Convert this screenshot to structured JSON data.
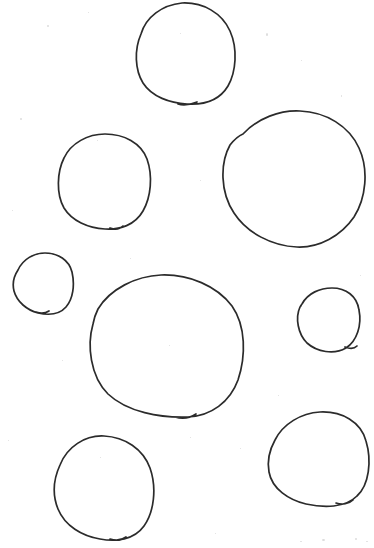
{
  "document": {
    "title": "Hand-drawn circles",
    "kind": "scanned-drawing",
    "width": 374,
    "height": 548,
    "background_color": "#ffffff",
    "ink_color": "#2b2b2b",
    "stroke_width": 1.7,
    "caption": ""
  },
  "shapes": [
    {
      "id": "circle-top-center",
      "name": "Top center circle",
      "size_label": "medium-large",
      "cx": 184,
      "cy": 54,
      "rx": 52,
      "ry": 51,
      "bbox": [
        132,
        3,
        236,
        105
      ],
      "closure_point": [
        186,
        103
      ],
      "rotation": -6,
      "path": "M 141 34 C 146 17 162 5 182 3 C 203 2 222 13 230 31 C 238 49 236 72 228 86 C 219 101 203 105 187 104 C 170 103 152 97 143 83 C 135 70 134 50 141 34 Z M 178 104 C 184 106 192 104 197 102"
    },
    {
      "id": "circle-right-large",
      "name": "Right large circle",
      "size_label": "large",
      "cx": 293,
      "cy": 179,
      "rx": 72,
      "ry": 69,
      "bbox": [
        221,
        110,
        365,
        248
      ],
      "closure_point": [
        243,
        133
      ],
      "rotation": 4,
      "path": "M 243 134 C 258 118 280 110 300 111 C 326 112 349 126 359 148 C 369 170 366 198 354 217 C 341 236 319 248 297 247 C 272 246 247 233 234 213 C 220 192 220 163 230 145 C 234 140 238 136 243 134 Z"
    },
    {
      "id": "circle-left-medium",
      "name": "Left medium circle",
      "size_label": "medium",
      "cx": 104,
      "cy": 182,
      "rx": 47,
      "ry": 48,
      "bbox": [
        57,
        134,
        151,
        230
      ],
      "closure_point": [
        119,
        227
      ],
      "rotation": -3,
      "path": "M 64 158 C 71 143 88 134 105 134 C 124 134 141 143 147 159 C 153 176 151 197 143 211 C 135 225 120 230 105 229 C 88 228 72 221 64 208 C 56 194 57 172 64 158 Z M 110 228 C 115 230 120 229 123 226"
    },
    {
      "id": "circle-left-small",
      "name": "Left small circle",
      "size_label": "small",
      "cx": 43,
      "cy": 284,
      "rx": 30,
      "ry": 31,
      "bbox": [
        13,
        253,
        73,
        315
      ],
      "closure_point": [
        42,
        312
      ],
      "rotation": 8,
      "path": "M 18 270 C 23 259 34 253 45 253 C 58 253 69 260 72 272 C 75 285 73 299 66 307 C 59 315 47 315 38 313 C 27 310 17 302 14 291 C 12 283 14 276 18 270 Z M 36 312 C 41 314 46 313 49 311"
    },
    {
      "id": "circle-center-large",
      "name": "Center large circle",
      "size_label": "large",
      "cx": 167,
      "cy": 347,
      "rx": 79,
      "ry": 72,
      "bbox": [
        88,
        275,
        246,
        419
      ],
      "closure_point": [
        188,
        416
      ],
      "rotation": -2,
      "path": "M 98 309 C 110 289 136 276 161 275 C 189 274 217 286 232 306 C 246 326 246 356 238 380 C 230 402 211 416 188 417 C 160 418 127 412 108 394 C 90 376 87 345 93 324 C 94 318 96 313 98 309 Z M 175 417 C 182 419 190 418 196 414"
    },
    {
      "id": "circle-right-small",
      "name": "Right small circle",
      "size_label": "small",
      "cx": 328,
      "cy": 320,
      "rx": 32,
      "ry": 32,
      "bbox": [
        296,
        288,
        360,
        352
      ],
      "closure_point": [
        352,
        348
      ],
      "rotation": -10,
      "path": "M 302 304 C 308 293 320 288 332 288 C 346 288 357 296 359 310 C 362 325 357 341 346 348 C 334 355 317 352 307 343 C 298 334 295 318 300 307 C 301 306 301 305 302 304 Z M 345 347 C 350 349 354 349 357 346"
    },
    {
      "id": "circle-bottom-left",
      "name": "Bottom left circle",
      "size_label": "medium",
      "cx": 103,
      "cy": 488,
      "rx": 50,
      "ry": 53,
      "bbox": [
        53,
        435,
        153,
        541
      ],
      "closure_point": [
        118,
        538
      ],
      "rotation": 5,
      "path": "M 60 465 C 67 447 85 435 104 436 C 125 437 143 449 150 468 C 157 488 154 512 144 526 C 134 540 116 542 100 539 C 82 536 65 526 58 509 C 52 494 54 478 60 465 Z M 110 539 C 116 541 122 540 126 537"
    },
    {
      "id": "circle-bottom-right",
      "name": "Bottom right circle",
      "size_label": "medium",
      "cx": 318,
      "cy": 460,
      "rx": 50,
      "ry": 48,
      "bbox": [
        268,
        412,
        368,
        508
      ],
      "closure_point": [
        345,
        502
      ],
      "rotation": -8,
      "path": "M 275 440 C 283 424 301 413 320 412 C 342 411 361 422 366 441 C 372 461 369 485 357 496 C 345 508 324 508 306 504 C 289 500 272 489 269 472 C 267 461 270 449 275 440 Z M 336 503 C 342 505 349 504 353 500"
    }
  ],
  "specks": [
    {
      "x": 47,
      "y": 25,
      "w": 2,
      "h": 2
    },
    {
      "x": 88,
      "y": 12,
      "w": 1,
      "h": 1
    },
    {
      "x": 266,
      "y": 33,
      "w": 2,
      "h": 3
    },
    {
      "x": 301,
      "y": 60,
      "w": 1,
      "h": 1
    },
    {
      "x": 20,
      "y": 118,
      "w": 2,
      "h": 2
    },
    {
      "x": 180,
      "y": 33,
      "w": 1,
      "h": 1
    },
    {
      "x": 97,
      "y": 140,
      "w": 1,
      "h": 1
    },
    {
      "x": 341,
      "y": 95,
      "w": 1,
      "h": 2
    },
    {
      "x": 12,
      "y": 210,
      "w": 1,
      "h": 1
    },
    {
      "x": 200,
      "y": 180,
      "w": 1,
      "h": 1
    },
    {
      "x": 169,
      "y": 345,
      "w": 1,
      "h": 1
    },
    {
      "x": 62,
      "y": 360,
      "w": 1,
      "h": 1
    },
    {
      "x": 278,
      "y": 395,
      "w": 1,
      "h": 1
    },
    {
      "x": 190,
      "y": 437,
      "w": 1,
      "h": 1
    },
    {
      "x": 240,
      "y": 448,
      "w": 1,
      "h": 1
    },
    {
      "x": 100,
      "y": 457,
      "w": 1,
      "h": 1
    },
    {
      "x": 322,
      "y": 539,
      "w": 3,
      "h": 2
    },
    {
      "x": 300,
      "y": 541,
      "w": 2,
      "h": 1
    },
    {
      "x": 355,
      "y": 538,
      "w": 2,
      "h": 2
    },
    {
      "x": 366,
      "y": 541,
      "w": 2,
      "h": 1
    },
    {
      "x": 215,
      "y": 533,
      "w": 1,
      "h": 1
    },
    {
      "x": 8,
      "y": 440,
      "w": 1,
      "h": 1
    },
    {
      "x": 360,
      "y": 275,
      "w": 1,
      "h": 1
    },
    {
      "x": 130,
      "y": 258,
      "w": 1,
      "h": 1
    }
  ]
}
